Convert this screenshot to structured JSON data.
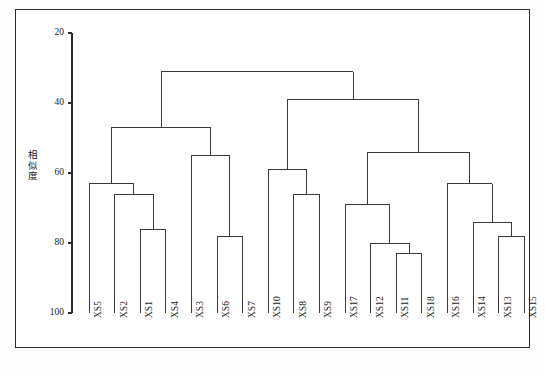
{
  "chart_data": {
    "type": "dendrogram",
    "title": "",
    "xlabel": "",
    "ylabel": "相似度",
    "ylim": [
      20,
      100
    ],
    "y_ticks": [
      20,
      40,
      60,
      80,
      100
    ],
    "y_axis_inverted": true,
    "grid": false,
    "legend": "none",
    "leaf_order": [
      "XS5",
      "XS2",
      "XS1",
      "XS4",
      "XS3",
      "XS6",
      "XS7",
      "XS10",
      "XS8",
      "XS9",
      "XS17",
      "XS12",
      "XS11",
      "XS18",
      "XS16",
      "XS14",
      "XS13",
      "XS15"
    ],
    "n_leaves": 18,
    "merges": [
      {
        "id": "m1",
        "children": [
          "XS1",
          "XS4"
        ],
        "height": 76
      },
      {
        "id": "m2",
        "children": [
          "XS2",
          "m1"
        ],
        "height": 66
      },
      {
        "id": "m3",
        "children": [
          "XS5",
          "m2"
        ],
        "height": 63
      },
      {
        "id": "m4",
        "children": [
          "XS6",
          "XS7"
        ],
        "height": 78
      },
      {
        "id": "m5",
        "children": [
          "XS3",
          "m4"
        ],
        "height": 55
      },
      {
        "id": "m6",
        "children": [
          "m3",
          "m5"
        ],
        "height": 47
      },
      {
        "id": "m7",
        "children": [
          "XS8",
          "XS9"
        ],
        "height": 66
      },
      {
        "id": "m8",
        "children": [
          "XS10",
          "m7"
        ],
        "height": 59
      },
      {
        "id": "m9",
        "children": [
          "XS11",
          "XS18"
        ],
        "height": 83
      },
      {
        "id": "m10",
        "children": [
          "XS12",
          "m9"
        ],
        "height": 80
      },
      {
        "id": "m11",
        "children": [
          "XS17",
          "m10"
        ],
        "height": 69
      },
      {
        "id": "m12",
        "children": [
          "XS13",
          "XS15"
        ],
        "height": 78
      },
      {
        "id": "m13",
        "children": [
          "XS14",
          "m12"
        ],
        "height": 74
      },
      {
        "id": "m14",
        "children": [
          "XS16",
          "m13"
        ],
        "height": 63
      },
      {
        "id": "m15",
        "children": [
          "m11",
          "m14"
        ],
        "height": 54
      },
      {
        "id": "m16",
        "children": [
          "m8",
          "m15"
        ],
        "height": 39
      },
      {
        "id": "m17",
        "children": [
          "m6",
          "m16"
        ],
        "height": 31
      }
    ],
    "axis_color": "#2b2b2b",
    "line_color": "#3a3a3a"
  },
  "page": {
    "caption": ""
  }
}
